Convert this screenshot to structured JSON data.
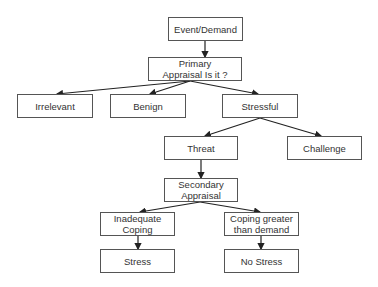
{
  "diagram": {
    "type": "flowchart",
    "nodes": [
      {
        "id": "event",
        "label": "Event/Demand",
        "x": 168,
        "y": 17,
        "w": 75,
        "h": 24
      },
      {
        "id": "primary",
        "label": "Primary\nAppraisal Is it ?",
        "x": 148,
        "y": 57,
        "w": 94,
        "h": 24
      },
      {
        "id": "irrelevant",
        "label": "Irrelevant",
        "x": 17,
        "y": 94,
        "w": 76,
        "h": 24
      },
      {
        "id": "benign",
        "label": "Benign",
        "x": 110,
        "y": 94,
        "w": 76,
        "h": 24
      },
      {
        "id": "stressful",
        "label": "Stressful",
        "x": 222,
        "y": 94,
        "w": 76,
        "h": 24
      },
      {
        "id": "threat",
        "label": "Threat",
        "x": 164,
        "y": 136,
        "w": 74,
        "h": 24
      },
      {
        "id": "challenge",
        "label": "Challenge",
        "x": 287,
        "y": 136,
        "w": 75,
        "h": 24
      },
      {
        "id": "secondary",
        "label": "Secondary\nAppraisal",
        "x": 164,
        "y": 178,
        "w": 74,
        "h": 24
      },
      {
        "id": "inadequate",
        "label": "Inadequate\nCoping",
        "x": 100,
        "y": 212,
        "w": 75,
        "h": 24
      },
      {
        "id": "coping_greater",
        "label": "Coping greater\nthan demand",
        "x": 224,
        "y": 212,
        "w": 75,
        "h": 24
      },
      {
        "id": "stress",
        "label": "Stress",
        "x": 100,
        "y": 249,
        "w": 75,
        "h": 24
      },
      {
        "id": "no_stress",
        "label": "No Stress",
        "x": 224,
        "y": 249,
        "w": 75,
        "h": 24
      }
    ],
    "edges": [
      {
        "from": "event",
        "to": "primary"
      },
      {
        "from": "primary",
        "to": "irrelevant"
      },
      {
        "from": "primary",
        "to": "benign"
      },
      {
        "from": "primary",
        "to": "stressful"
      },
      {
        "from": "stressful",
        "to": "threat"
      },
      {
        "from": "stressful",
        "to": "challenge"
      },
      {
        "from": "threat",
        "to": "secondary"
      },
      {
        "from": "secondary",
        "to": "inadequate"
      },
      {
        "from": "secondary",
        "to": "coping_greater"
      },
      {
        "from": "inadequate",
        "to": "stress"
      },
      {
        "from": "coping_greater",
        "to": "no_stress"
      }
    ],
    "colors": {
      "border": "#555555",
      "text": "#333333",
      "arrow": "#222222"
    }
  }
}
